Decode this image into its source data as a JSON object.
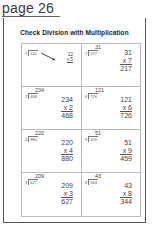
{
  "page": {
    "label": "page 26"
  },
  "worksheet": {
    "title": "Check Division with Multiplication",
    "problems": [
      {
        "divisor": "5",
        "dividend": "110",
        "quotient": "22",
        "check_top": "22",
        "check_mult": "x 5",
        "check_result": "110"
      },
      {
        "divisor": "7",
        "dividend": "217",
        "quotient": "31",
        "check_top": "31",
        "check_mult": "x 7",
        "check_result": "217"
      },
      {
        "divisor": "2",
        "dividend": "468",
        "quotient": "234",
        "check_top": "234",
        "check_mult": "x 2",
        "check_result": "468"
      },
      {
        "divisor": "6",
        "dividend": "726",
        "quotient": "121",
        "check_top": "121",
        "check_mult": "x 6",
        "check_result": "726"
      },
      {
        "divisor": "4",
        "dividend": "880",
        "quotient": "220",
        "check_top": "220",
        "check_mult": "x 4",
        "check_result": "880"
      },
      {
        "divisor": "9",
        "dividend": "459",
        "quotient": "51",
        "check_top": "51",
        "check_mult": "x 9",
        "check_result": "459"
      },
      {
        "divisor": "3",
        "dividend": "627",
        "quotient": "209",
        "check_top": "209",
        "check_mult": "x 3",
        "check_result": "627"
      },
      {
        "divisor": "8",
        "dividend": "344",
        "quotient": "43",
        "check_top": "43",
        "check_mult": "x 8",
        "check_result": "344"
      }
    ]
  }
}
